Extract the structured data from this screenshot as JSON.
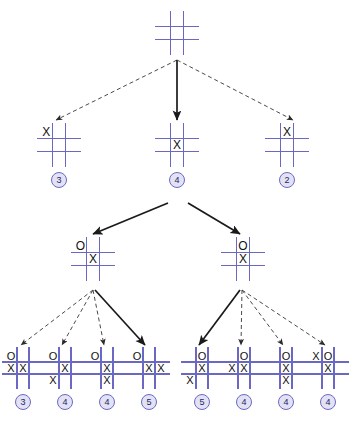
{
  "figure": {
    "type": "game-tree",
    "colors": {
      "grid": "#6b68c4",
      "mark": "#111111",
      "badge_fill": "#e2e2f4",
      "badge_border": "#6b68c4",
      "badge_text": "#24246a",
      "edge_solid": "#1a1a1a",
      "edge_dashed": "#4a4a4a",
      "background": "#ffffff"
    }
  },
  "nodes": [
    {
      "id": "root",
      "level": 0,
      "x": 158,
      "y": 14,
      "size": 38,
      "marks": [
        "",
        "",
        "",
        "",
        "",
        "",
        "",
        "",
        ""
      ],
      "value": null
    },
    {
      "id": "n1-left",
      "level": 1,
      "x": 40,
      "y": 126,
      "size": 38,
      "marks": [
        "X",
        "",
        "",
        "",
        "",
        "",
        "",
        "",
        ""
      ],
      "value": "3"
    },
    {
      "id": "n1-mid",
      "level": 1,
      "x": 158,
      "y": 126,
      "size": 38,
      "marks": [
        "",
        "",
        "",
        "",
        "X",
        "",
        "",
        "",
        ""
      ],
      "value": "4"
    },
    {
      "id": "n1-right",
      "level": 1,
      "x": 268,
      "y": 126,
      "size": 38,
      "marks": [
        "",
        "X",
        "",
        "",
        "",
        "",
        "",
        "",
        ""
      ],
      "value": "2"
    },
    {
      "id": "n2-left",
      "level": 2,
      "x": 74,
      "y": 240,
      "size": 38,
      "marks": [
        "O",
        "",
        "",
        "",
        "X",
        "",
        "",
        "",
        ""
      ],
      "value": null
    },
    {
      "id": "n2-right",
      "level": 2,
      "x": 224,
      "y": 240,
      "size": 38,
      "marks": [
        "",
        "O",
        "",
        "",
        "X",
        "",
        "",
        "",
        ""
      ],
      "value": null
    },
    {
      "id": "leaf-1",
      "level": 3,
      "x": 5,
      "y": 350,
      "size": 36,
      "marks": [
        "O",
        "",
        "",
        "X",
        "X",
        "",
        "",
        "",
        ""
      ],
      "value": "3"
    },
    {
      "id": "leaf-2",
      "level": 3,
      "x": 47,
      "y": 350,
      "size": 36,
      "marks": [
        "O",
        "",
        "",
        "",
        "X",
        "",
        "X",
        "",
        ""
      ],
      "value": "4"
    },
    {
      "id": "leaf-3",
      "level": 3,
      "x": 89,
      "y": 350,
      "size": 36,
      "marks": [
        "O",
        "",
        "",
        "",
        "X",
        "",
        "",
        "X",
        ""
      ],
      "value": "4"
    },
    {
      "id": "leaf-4",
      "level": 3,
      "x": 131,
      "y": 350,
      "size": 36,
      "marks": [
        "O",
        "",
        "",
        "",
        "X",
        "X",
        "",
        "",
        ""
      ],
      "value": "5"
    },
    {
      "id": "leaf-5",
      "level": 3,
      "x": 184,
      "y": 350,
      "size": 36,
      "marks": [
        "",
        "O",
        "",
        "",
        "X",
        "",
        "X",
        "",
        ""
      ],
      "value": "5"
    },
    {
      "id": "leaf-6",
      "level": 3,
      "x": 226,
      "y": 350,
      "size": 36,
      "marks": [
        "",
        "O",
        "",
        "X",
        "X",
        "",
        "",
        "",
        ""
      ],
      "value": "4"
    },
    {
      "id": "leaf-7",
      "level": 3,
      "x": 268,
      "y": 350,
      "size": 36,
      "marks": [
        "",
        "O",
        "",
        "",
        "X",
        "",
        "",
        "X",
        ""
      ],
      "value": "4"
    },
    {
      "id": "leaf-8",
      "level": 3,
      "x": 310,
      "y": 350,
      "size": 36,
      "marks": [
        "X",
        "O",
        "",
        "",
        "X",
        "",
        "",
        "",
        ""
      ],
      "value": "4"
    }
  ],
  "edges": [
    {
      "id": "e-root-left",
      "from": "root",
      "to": "n1-left",
      "style": "dashed",
      "x1": 177,
      "y1": 60,
      "x2": 56,
      "y2": 120
    },
    {
      "id": "e-root-mid",
      "from": "root",
      "to": "n1-mid",
      "style": "solid",
      "x1": 177,
      "y1": 60,
      "x2": 177,
      "y2": 120
    },
    {
      "id": "e-root-right",
      "from": "root",
      "to": "n1-right",
      "style": "dashed",
      "x1": 177,
      "y1": 60,
      "x2": 293,
      "y2": 120
    },
    {
      "id": "e-mid-l",
      "from": "n1-mid",
      "to": "n2-left",
      "style": "solid",
      "x1": 168,
      "y1": 203,
      "x2": 93,
      "y2": 234
    },
    {
      "id": "e-mid-r",
      "from": "n1-mid",
      "to": "n2-right",
      "style": "solid",
      "x1": 188,
      "y1": 203,
      "x2": 240,
      "y2": 234
    },
    {
      "id": "e-l2-1",
      "from": "n2-left",
      "to": "leaf-1",
      "style": "dashed",
      "x1": 93,
      "y1": 290,
      "x2": 21,
      "y2": 345
    },
    {
      "id": "e-l2-2",
      "from": "n2-left",
      "to": "leaf-2",
      "style": "dashed",
      "x1": 93,
      "y1": 290,
      "x2": 62,
      "y2": 345
    },
    {
      "id": "e-l2-3",
      "from": "n2-left",
      "to": "leaf-3",
      "style": "dashed",
      "x1": 93,
      "y1": 290,
      "x2": 104,
      "y2": 345
    },
    {
      "id": "e-l2-4",
      "from": "n2-left",
      "to": "leaf-4",
      "style": "solid",
      "x1": 95,
      "y1": 290,
      "x2": 145,
      "y2": 345
    },
    {
      "id": "e-r2-5",
      "from": "n2-right",
      "to": "leaf-5",
      "style": "solid",
      "x1": 240,
      "y1": 290,
      "x2": 199,
      "y2": 345
    },
    {
      "id": "e-r2-6",
      "from": "n2-right",
      "to": "leaf-6",
      "style": "dashed",
      "x1": 242,
      "y1": 290,
      "x2": 241,
      "y2": 345
    },
    {
      "id": "e-r2-7",
      "from": "n2-right",
      "to": "leaf-7",
      "style": "dashed",
      "x1": 242,
      "y1": 290,
      "x2": 283,
      "y2": 345
    },
    {
      "id": "e-r2-8",
      "from": "n2-right",
      "to": "leaf-8",
      "style": "dashed",
      "x1": 242,
      "y1": 290,
      "x2": 325,
      "y2": 345
    }
  ]
}
